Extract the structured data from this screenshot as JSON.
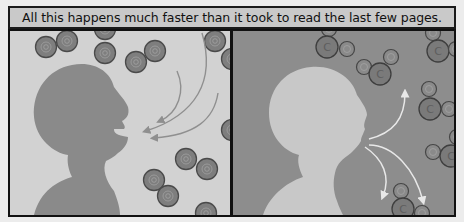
{
  "caption": {
    "text": "All this happens much faster than it took to read the last few pages."
  },
  "panels": [
    {
      "id": "inhale",
      "background": "#d2d2d2",
      "silhouette_color": "#8a8a8a",
      "arrow_color": "#8f8f8f",
      "molecule": "oxygen",
      "molecule_color": "#7e7e7e"
    },
    {
      "id": "exhale",
      "background": "#8d8d8d",
      "silhouette_color": "#c8c8c8",
      "arrow_color": "#e8e8e8",
      "molecule": "carbon-dioxide",
      "molecule_color": "#7a7a7a",
      "carbon_label": "C"
    }
  ],
  "colors": {
    "border": "#111111",
    "caption_bg": "#c9c9c9"
  }
}
